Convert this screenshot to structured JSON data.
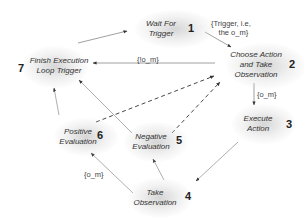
{
  "nodes": [
    {
      "id": 1,
      "num": "1",
      "line1": "Wait For",
      "line2": "Trigger"
    },
    {
      "id": 2,
      "num": "2",
      "line1": "Choose Action",
      "line2": "and Take",
      "line3": "Observation"
    },
    {
      "id": 3,
      "num": "3",
      "line1": "Execute",
      "line2": "Action"
    },
    {
      "id": 4,
      "num": "4",
      "line1": "Take",
      "line2": "Observation"
    },
    {
      "id": 5,
      "num": "5",
      "line1": "Negative",
      "line2": "Evaluation"
    },
    {
      "id": 6,
      "num": "6",
      "line1": "Positive",
      "line2": "Evaluation"
    },
    {
      "id": 7,
      "num": "7",
      "line1": "Finish Execution",
      "line2": "Loop Trigger"
    }
  ],
  "edges": [
    {
      "from": 7,
      "to": 1,
      "label": "",
      "style": "solid"
    },
    {
      "from": 1,
      "to": 2,
      "label_line1": "{Trigger, i.e,",
      "label_line2": "the o_m}",
      "style": "solid"
    },
    {
      "from": 2,
      "to": 7,
      "label": "{!o_m}",
      "style": "solid"
    },
    {
      "from": 2,
      "to": 3,
      "label": "{o_m}",
      "style": "solid"
    },
    {
      "from": 3,
      "to": 4,
      "label": "",
      "style": "solid"
    },
    {
      "from": 4,
      "to": 5,
      "label": "{o_m}",
      "style": "solid"
    },
    {
      "from": 4,
      "to": 6,
      "label": "{!o_m}",
      "style": "solid"
    },
    {
      "from": 6,
      "to": 7,
      "label": "",
      "style": "solid"
    },
    {
      "from": 5,
      "to": 7,
      "label": "",
      "style": "solid"
    },
    {
      "from": 6,
      "to": 2,
      "label": "",
      "style": "dashed"
    },
    {
      "from": 5,
      "to": 2,
      "label": "",
      "style": "dashed"
    }
  ]
}
